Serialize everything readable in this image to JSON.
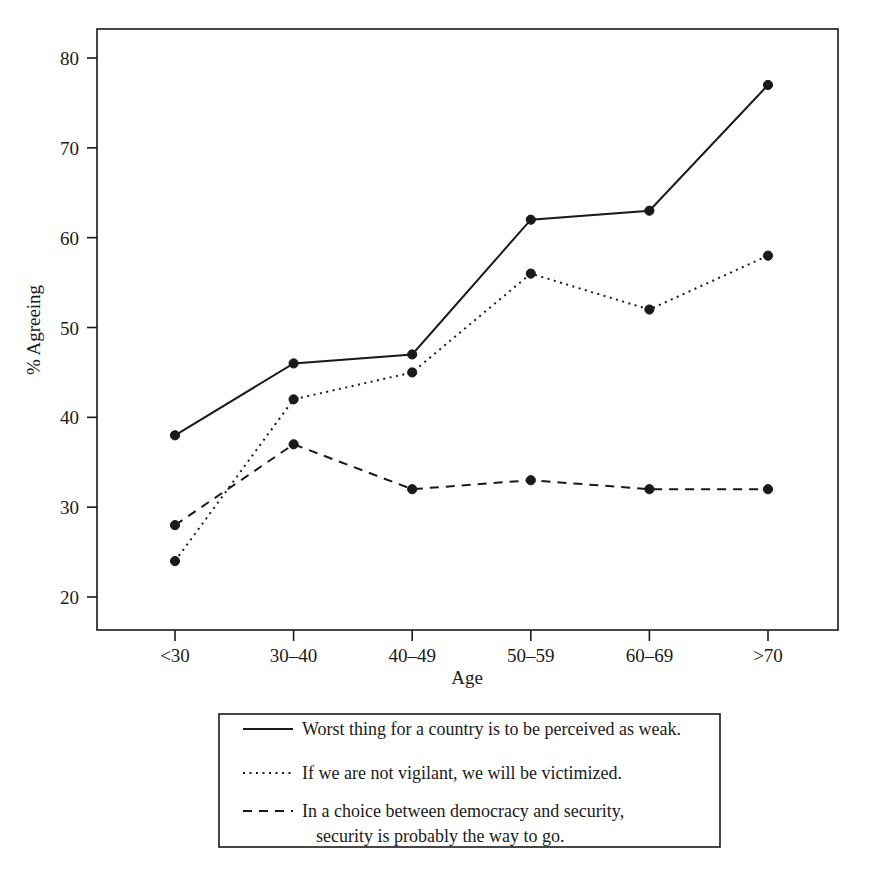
{
  "chart_data": {
    "type": "line",
    "title": "",
    "xlabel": "Age",
    "ylabel": "% Agreeing",
    "categories": [
      "<30",
      "30–40",
      "40–49",
      "50–59",
      "60–69",
      ">70"
    ],
    "xtick_labels": [
      "<30",
      "30–40",
      "40–49",
      "50–59",
      "60–69",
      ">70"
    ],
    "ytick_labels": [
      "20",
      "30",
      "40",
      "50",
      "60",
      "70",
      "80"
    ],
    "ytick_values": [
      20,
      30,
      40,
      50,
      60,
      70,
      80
    ],
    "ylim": [
      17,
      82
    ],
    "grid": false,
    "legend_position": "below-plot",
    "series": [
      {
        "name": "Worst thing for a country is to be perceived as weak.",
        "style": "solid",
        "color": "#1a1a1a",
        "values": [
          38,
          46,
          47,
          62,
          63,
          77
        ]
      },
      {
        "name": "If we are not vigilant, we will be victimized.",
        "style": "dotted",
        "color": "#1a1a1a",
        "values": [
          24,
          42,
          45,
          56,
          52,
          58
        ]
      },
      {
        "name": "In a choice between democracy and security, security is probably the way to go.",
        "style": "dashed",
        "color": "#1a1a1a",
        "values": [
          28,
          37,
          32,
          33,
          32,
          32
        ]
      }
    ]
  },
  "legend": {
    "entries": [
      {
        "style": "solid",
        "line1": "Worst thing for a country is to be perceived as weak.",
        "line2": ""
      },
      {
        "style": "dotted",
        "line1": "If we are not vigilant, we will be victimized.",
        "line2": ""
      },
      {
        "style": "dashed",
        "line1": "In a choice between democracy and security,",
        "line2": "security is probably the way to go."
      }
    ]
  }
}
